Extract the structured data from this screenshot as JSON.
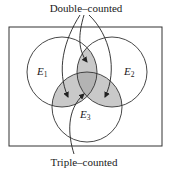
{
  "diagram": {
    "type": "venn",
    "title": "",
    "annotations": {
      "top": "Double–counted",
      "bottom": "Triple–counted"
    },
    "universe": {
      "x": 9,
      "y": 27,
      "width": 153,
      "height": 119,
      "stroke": "#333333"
    },
    "sets": [
      {
        "id": "E1",
        "letter": "E",
        "subscript": "1",
        "cx": 62,
        "cy": 72,
        "r": 35
      },
      {
        "id": "E2",
        "letter": "E",
        "subscript": "2",
        "cx": 112,
        "cy": 72,
        "r": 35
      },
      {
        "id": "E3",
        "letter": "E",
        "subscript": "3",
        "cx": 87,
        "cy": 107,
        "r": 35
      }
    ],
    "regions": {
      "pairwise_fill": "#c9c9c9",
      "triple_fill": "#b3b3b3",
      "double_counted": [
        "E1∩E2",
        "E1∩E3",
        "E2∩E3"
      ],
      "triple_counted": [
        "E1∩E2∩E3"
      ]
    },
    "arrows": {
      "double_counted_targets": [
        "E1∩E3",
        "E1∩E2",
        "E2∩E3"
      ],
      "triple_counted_targets": [
        "E1∩E2∩E3"
      ]
    },
    "colors": {
      "stroke": "#333333",
      "text": "#1a1a1a",
      "background": "#ffffff"
    }
  }
}
